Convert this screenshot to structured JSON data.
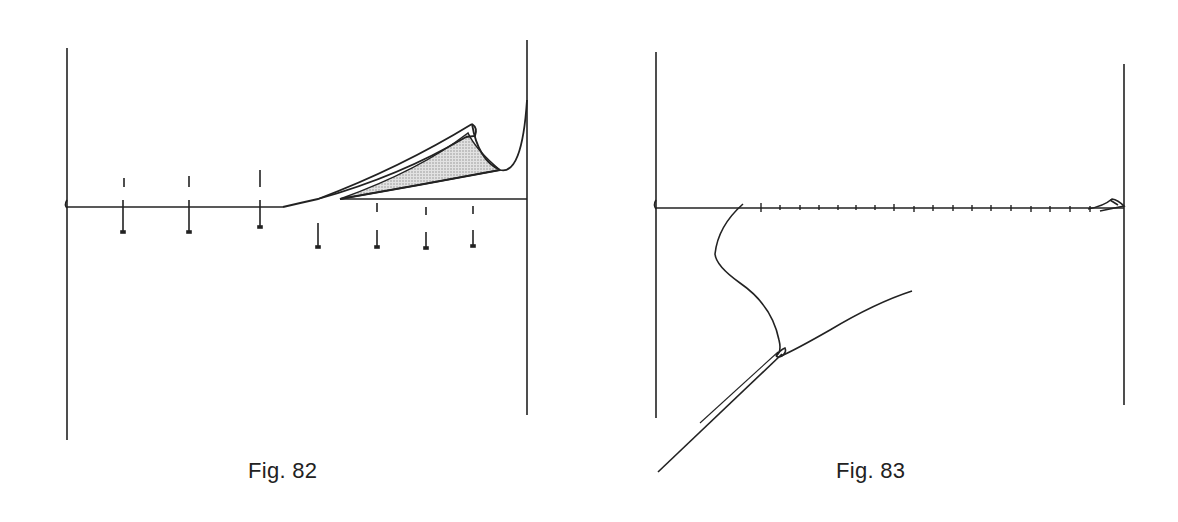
{
  "figures": [
    {
      "id": "fig82",
      "caption": "Fig. 82",
      "description": "Line with vertical markers above and below; right end curls up into a shaded folded wedge against the right wall",
      "left_wall_x": 67,
      "right_wall_x": 527,
      "baseline_y": 207,
      "markers_left": [
        123,
        189,
        260
      ],
      "markers_right": [
        318,
        377,
        426,
        473
      ],
      "fill_color": "#c8c8c8",
      "stroke_color": "#222222"
    },
    {
      "id": "fig83",
      "caption": "Fig. 83",
      "description": "Horizontal line with small tick marks; a strand loops down from the left, twists, and forks into a diagonal tail and a rising branch",
      "left_wall_x": 656,
      "right_wall_x": 1124,
      "baseline_y": 208,
      "tick_count": 19,
      "stroke_color": "#222222"
    }
  ]
}
